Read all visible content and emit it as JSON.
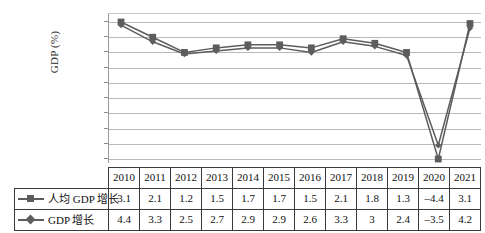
{
  "chart_data": {
    "type": "line",
    "title": "",
    "xlabel": "",
    "ylabel": "GDP (%)",
    "categories": [
      "2010",
      "2011",
      "2012",
      "2013",
      "2014",
      "2015",
      "2016",
      "2017",
      "2018",
      "2019",
      "2020",
      "2021"
    ],
    "series": [
      {
        "name": "人均 GDP 增长",
        "marker": "square",
        "values": [
          3.1,
          2.1,
          1.2,
          1.5,
          1.7,
          1.7,
          1.5,
          2.1,
          1.8,
          1.3,
          -4.4,
          3.1
        ],
        "labels": [
          "3.1",
          "2.1",
          "1.2",
          "1.5",
          "1.7",
          "1.7",
          "1.5",
          "2.1",
          "1.8",
          "1.3",
          "–4.4",
          "3.1"
        ]
      },
      {
        "name": "GDP 增长",
        "marker": "diamond",
        "values": [
          4.4,
          3.3,
          2.5,
          2.7,
          2.9,
          2.9,
          2.6,
          3.3,
          3.0,
          2.4,
          -3.5,
          4.2
        ],
        "labels": [
          "4.4",
          "3.3",
          "2.5",
          "2.7",
          "2.9",
          "2.9",
          "2.6",
          "3.3",
          "3",
          "2.4",
          "–3.5",
          "4.2"
        ]
      }
    ],
    "ylim": [
      -5.0,
      5.0
    ],
    "gridlines": 10,
    "grid": true,
    "legend_position": "table-row-labels",
    "tick_labels_y": [],
    "colors": {
      "series_line": "#5d5d5d",
      "marker": "#5d5d5d",
      "gridline": "#b9b9b9",
      "axis": "#9a9a9a",
      "table_border": "#3a3a3a",
      "text": "#111111"
    }
  },
  "table": {
    "corner_blank": "",
    "header": [
      "2010",
      "2011",
      "2012",
      "2013",
      "2014",
      "2015",
      "2016",
      "2017",
      "2018",
      "2019",
      "2020",
      "2021"
    ],
    "rows": [
      {
        "label": "人均 GDP 增长",
        "marker": "square",
        "cells": [
          "3.1",
          "2.1",
          "1.2",
          "1.5",
          "1.7",
          "1.7",
          "1.5",
          "2.1",
          "1.8",
          "1.3",
          "–4.4",
          "3.1"
        ]
      },
      {
        "label": "GDP 增长",
        "marker": "diamond",
        "cells": [
          "4.4",
          "3.3",
          "2.5",
          "2.7",
          "2.9",
          "2.9",
          "2.6",
          "3.3",
          "3",
          "2.4",
          "–3.5",
          "4.2"
        ]
      }
    ]
  }
}
